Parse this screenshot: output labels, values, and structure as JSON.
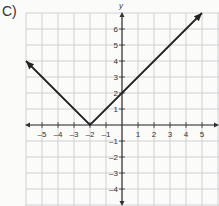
{
  "problem_label": "C)",
  "chart_data": {
    "type": "line",
    "title": "",
    "xlabel": "",
    "ylabel": "y",
    "function": "y = |x + 2|",
    "vertex": [
      -2,
      0
    ],
    "series": [
      {
        "name": "absolute value graph",
        "x": [
          -6,
          -2,
          5
        ],
        "y": [
          4,
          0,
          7
        ],
        "arrows": "both ends"
      }
    ],
    "x_ticks": [
      -5,
      -4,
      -3,
      -2,
      -1,
      1,
      2,
      3,
      4,
      5
    ],
    "y_ticks": [
      6,
      5,
      4,
      3,
      2,
      1,
      -1,
      -2,
      -3,
      -4
    ],
    "xlim": [
      -6,
      6
    ],
    "ylim": [
      -5,
      7
    ],
    "grid": true,
    "colors": {
      "line": "#222222",
      "grid": "#c8c8c8",
      "axis": "#333333"
    }
  }
}
